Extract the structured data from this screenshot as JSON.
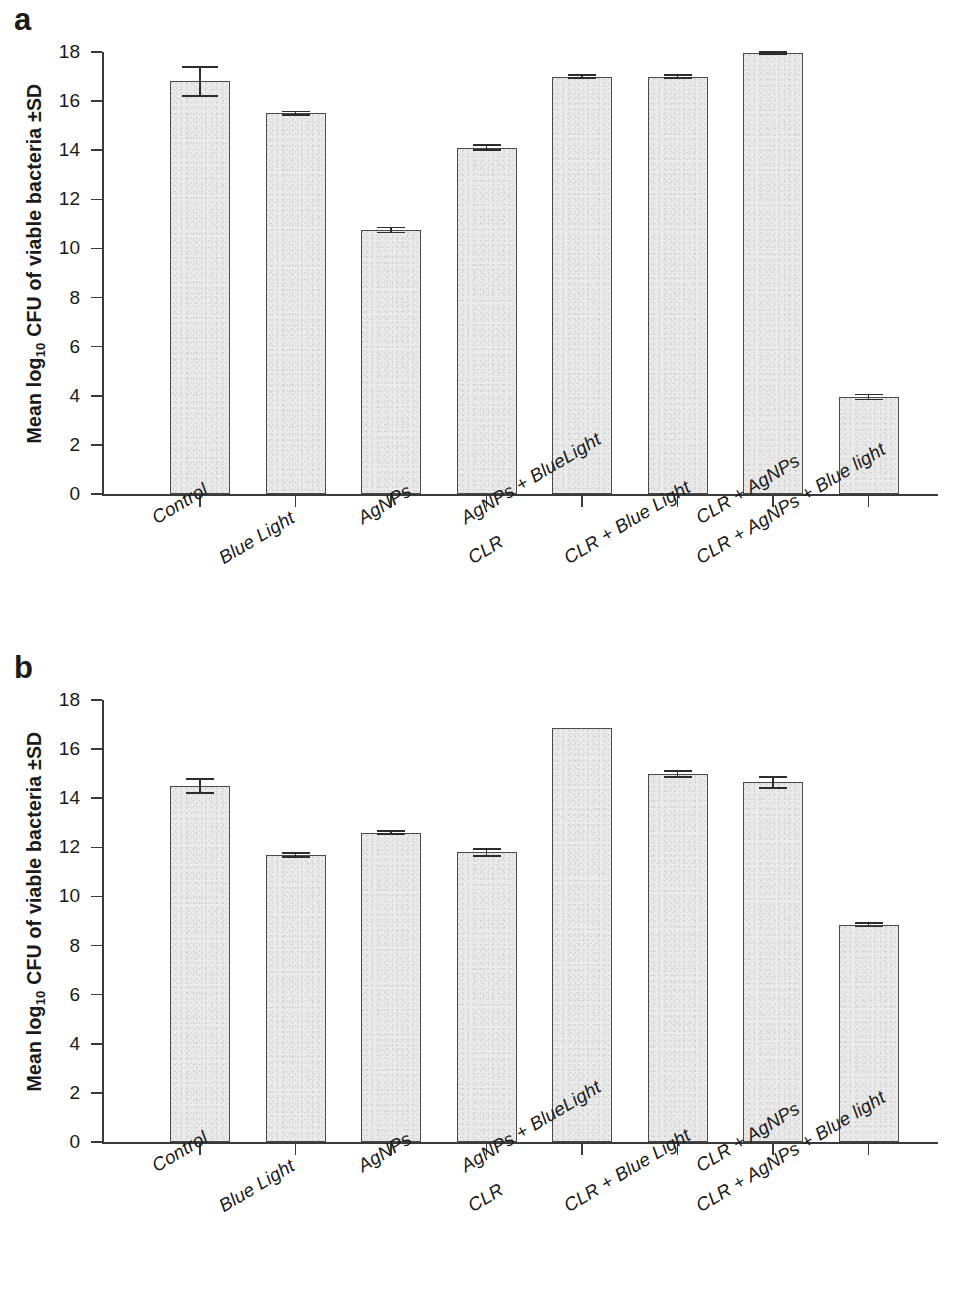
{
  "figure": {
    "panels": [
      {
        "letter": "a"
      },
      {
        "letter": "b"
      }
    ],
    "y_axis_title_prefix": "Mean log",
    "y_axis_title_sub": "10",
    "y_axis_title_suffix": " CFU of viable bacteria ±SD"
  },
  "chart_data": [
    {
      "type": "bar",
      "panel": "a",
      "title": "",
      "xlabel": "",
      "ylabel": "Mean log10 CFU of viable bacteria ±SD",
      "ylim": [
        0,
        18
      ],
      "yticks": [
        0,
        2,
        4,
        6,
        8,
        10,
        12,
        14,
        16,
        18
      ],
      "ytick_labels": [
        "0",
        "2",
        "4",
        "6",
        "8",
        "10",
        "12",
        "14",
        "16",
        "18"
      ],
      "grid": false,
      "legend": null,
      "categories": [
        "Control",
        "Blue  Light",
        "AgNPs",
        "CLR",
        "AgNPs + BlueLight",
        "CLR + Blue Light",
        "CLR + AgNPs",
        "CLR + AgNPs + Blue light"
      ],
      "values": [
        16.8,
        15.5,
        10.75,
        14.1,
        17.0,
        17.0,
        17.95,
        3.95
      ],
      "errors": [
        0.6,
        0.08,
        0.1,
        0.1,
        0.05,
        0.05,
        0.04,
        0.1
      ]
    },
    {
      "type": "bar",
      "panel": "b",
      "title": "",
      "xlabel": "",
      "ylabel": "Mean log10 CFU of viable bacteria ±SD",
      "ylim": [
        0,
        18
      ],
      "yticks": [
        0,
        2,
        4,
        6,
        8,
        10,
        12,
        14,
        16,
        18
      ],
      "ytick_labels": [
        "0",
        "2",
        "4",
        "6",
        "8",
        "10",
        "12",
        "14",
        "16",
        "18"
      ],
      "grid": false,
      "legend": null,
      "categories": [
        "Control",
        "Blue  Light",
        "AgNPs",
        "CLR",
        "AgNPs + BlueLight",
        "CLR + Blue Light",
        "CLR + AgNPs",
        "CLR + AgNPs + Blue light"
      ],
      "values": [
        14.5,
        11.7,
        12.6,
        11.8,
        16.85,
        15.0,
        14.65,
        8.85
      ],
      "errors": [
        0.28,
        0.08,
        0.07,
        0.14,
        0.0,
        0.12,
        0.22,
        0.07
      ]
    }
  ],
  "colors": {
    "bar_fill": "#ebebeb",
    "bar_stroke": "#4a4a4a",
    "axis": "#3a3a3a",
    "text": "#1a1a1a"
  }
}
